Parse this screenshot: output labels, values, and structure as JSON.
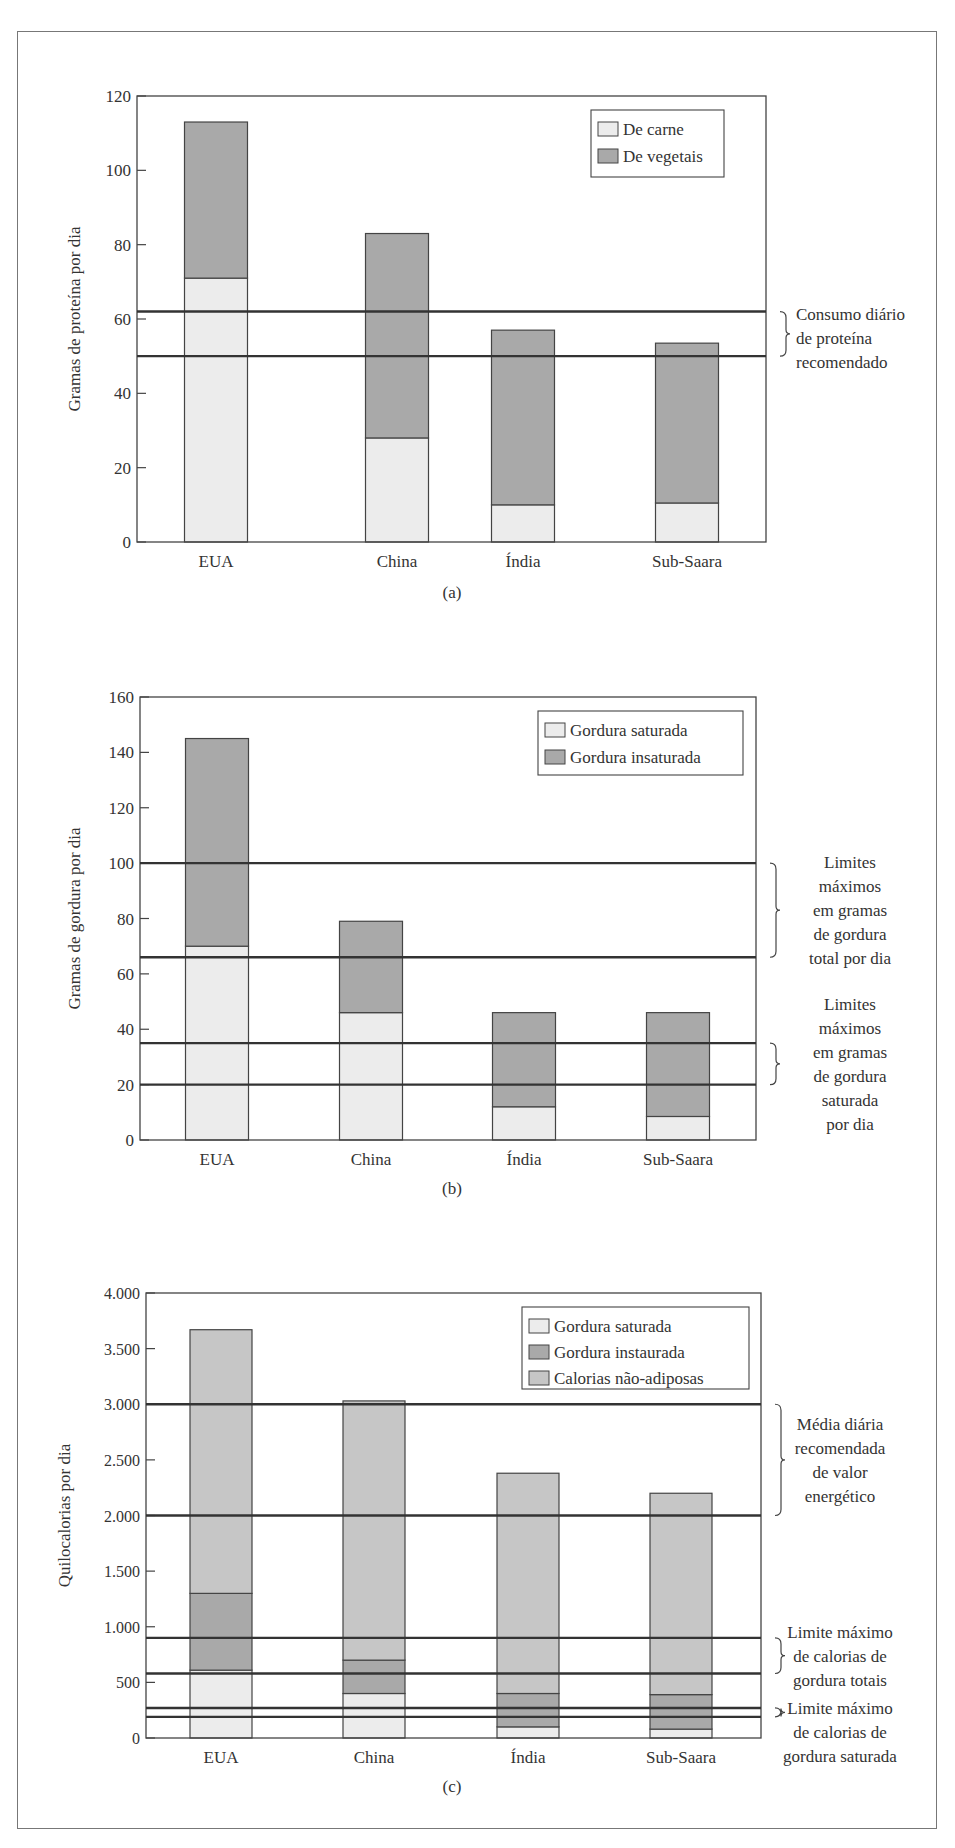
{
  "colors": {
    "light_fill": "#ececec",
    "dark_fill": "#a9a9a9",
    "mid_fill": "#c6c6c6",
    "line": "#333333",
    "frame": "#777777"
  },
  "chart_data": [
    {
      "id": "a",
      "type": "bar",
      "stacked": true,
      "caption": "(a)",
      "title": "",
      "xlabel": "",
      "ylabel": "Gramas de proteína por dia",
      "ylim": [
        0,
        120
      ],
      "yticks": [
        0,
        20,
        40,
        60,
        80,
        100,
        120
      ],
      "ytick_labels": [
        "0",
        "20",
        "40",
        "60",
        "80",
        "100",
        "120"
      ],
      "categories": [
        "EUA",
        "China",
        "Índia",
        "Sub-Saara"
      ],
      "series": [
        {
          "name": "De carne",
          "values": [
            71,
            28,
            10,
            10.5
          ],
          "fill": "light"
        },
        {
          "name": "De vegetais",
          "values": [
            42,
            55,
            47,
            43
          ],
          "fill": "dark"
        }
      ],
      "totals": [
        113,
        83,
        57,
        53.5
      ],
      "legend": {
        "position": "upper right",
        "entries": [
          "De carne",
          "De vegetais"
        ]
      },
      "reference_lines": [
        62,
        50
      ],
      "annotations": [
        {
          "text_lines": [
            "Consumo diário",
            "de proteína",
            "recomendado"
          ],
          "range": [
            50,
            62
          ]
        }
      ],
      "grid": false
    },
    {
      "id": "b",
      "type": "bar",
      "stacked": true,
      "caption": "(b)",
      "title": "",
      "xlabel": "",
      "ylabel": "Gramas de gordura por dia",
      "ylim": [
        0,
        160
      ],
      "yticks": [
        0,
        20,
        40,
        60,
        80,
        100,
        120,
        140,
        160
      ],
      "ytick_labels": [
        "0",
        "20",
        "40",
        "60",
        "80",
        "100",
        "120",
        "140",
        "160"
      ],
      "categories": [
        "EUA",
        "China",
        "Índia",
        "Sub-Saara"
      ],
      "series": [
        {
          "name": "Gordura saturada",
          "values": [
            70,
            46,
            12,
            8.5
          ],
          "fill": "light"
        },
        {
          "name": "Gordura insaturada",
          "values": [
            75,
            33,
            34,
            37.5
          ],
          "fill": "dark"
        }
      ],
      "totals": [
        145,
        79,
        46,
        46
      ],
      "legend": {
        "position": "upper right",
        "entries": [
          "Gordura saturada",
          "Gordura insaturada"
        ]
      },
      "reference_lines": [
        100,
        66,
        35,
        20
      ],
      "annotations": [
        {
          "text_lines": [
            "Limites",
            "máximos",
            "em gramas",
            "de gordura",
            "total por dia"
          ],
          "range": [
            66,
            100
          ]
        },
        {
          "text_lines": [
            "Limites",
            "máximos",
            "em gramas",
            "de gordura",
            "saturada",
            "por dia"
          ],
          "range": [
            20,
            35
          ]
        }
      ],
      "grid": false
    },
    {
      "id": "c",
      "type": "bar",
      "stacked": true,
      "caption": "(c)",
      "title": "",
      "xlabel": "",
      "ylabel": "Quilocalorias por dia",
      "ylim": [
        0,
        4000
      ],
      "yticks": [
        0,
        500,
        1000,
        1500,
        2000,
        2500,
        3000,
        3500,
        4000
      ],
      "ytick_labels": [
        "0",
        "500",
        "1.000",
        "1.500",
        "2.000",
        "2.500",
        "3.000",
        "3.500",
        "4.000"
      ],
      "categories": [
        "EUA",
        "China",
        "Índia",
        "Sub-Saara"
      ],
      "series": [
        {
          "name": "Gordura saturada",
          "values": [
            610,
            400,
            100,
            80
          ],
          "fill": "light"
        },
        {
          "name": "Gordura instaurada",
          "values": [
            690,
            300,
            300,
            310
          ],
          "fill": "dark"
        },
        {
          "name": "Calorias não-adiposas",
          "values": [
            2370,
            2330,
            1980,
            1810
          ],
          "fill": "mid"
        }
      ],
      "totals": [
        3670,
        3030,
        2380,
        2200
      ],
      "legend": {
        "position": "upper right",
        "entries": [
          "Gordura saturada",
          "Gordura instaurada",
          "Calorias não-adiposas"
        ]
      },
      "reference_lines": [
        3000,
        2000,
        900,
        580,
        270,
        190
      ],
      "annotations": [
        {
          "text_lines": [
            "Média diária",
            "recomendada",
            "de valor",
            "energético"
          ],
          "range": [
            2000,
            3000
          ]
        },
        {
          "text_lines": [
            "Limite máximo",
            "de calorias de",
            "gordura totais"
          ],
          "range": [
            580,
            900
          ]
        },
        {
          "text_lines": [
            "Limite máximo",
            "de calorias de",
            "gordura saturada"
          ],
          "range": [
            190,
            270
          ]
        }
      ],
      "grid": false
    }
  ]
}
